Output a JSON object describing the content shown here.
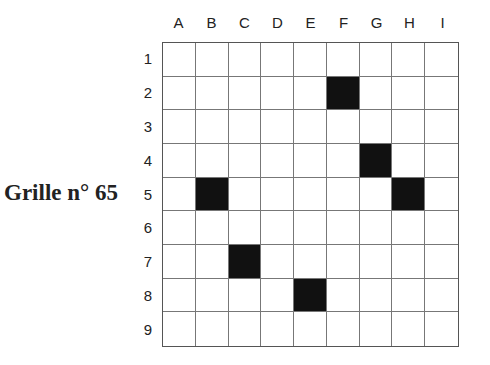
{
  "title": "Grille n° 65",
  "grid": {
    "columns": [
      "A",
      "B",
      "C",
      "D",
      "E",
      "F",
      "G",
      "H",
      "I"
    ],
    "rows": [
      "1",
      "2",
      "3",
      "4",
      "5",
      "6",
      "7",
      "8",
      "9"
    ],
    "black_cells": [
      "F2",
      "G4",
      "B5",
      "H5",
      "C7",
      "E8"
    ],
    "colors": {
      "black": "#111111",
      "white": "#ffffff",
      "line": "#777777"
    }
  }
}
